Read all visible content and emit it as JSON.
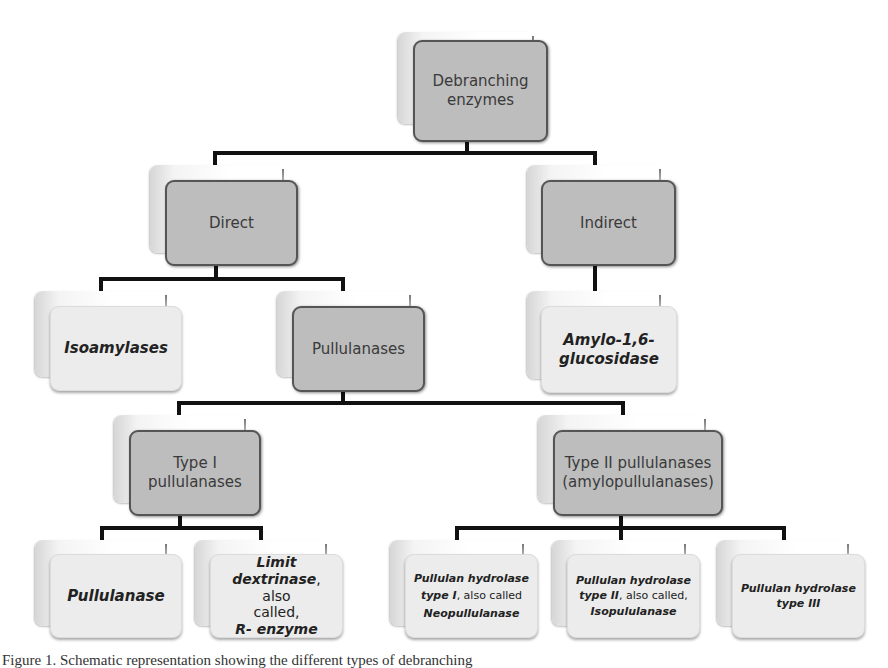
{
  "diagram": {
    "root": {
      "label_line1": "Debranching",
      "label_line2": "enzymes"
    },
    "level1": {
      "direct": {
        "label": "Direct"
      },
      "indirect": {
        "label": "Indirect"
      }
    },
    "level2": {
      "isoamylases": {
        "label": "Isoamylases"
      },
      "pullulanases": {
        "label": "Pullulanases"
      },
      "amylo": {
        "label_line1": "Amylo-1,6-",
        "label_line2": "glucosidase"
      }
    },
    "level3": {
      "type1": {
        "label_line1": "Type I",
        "label_line2": "pullulanases"
      },
      "type2": {
        "label_line1": "Type II pullulanases",
        "label_line2": "(amylopullulanases)"
      }
    },
    "level4": {
      "pullulanase": {
        "label": "Pullulanase"
      },
      "limit_dextrinase": {
        "line1": "Limit",
        "line2_bold": "dextrinase",
        "line2_rest": ", also",
        "line3": "called,",
        "line4": "R- enzyme"
      },
      "ph1": {
        "line1": "Pullulan hydrolase",
        "line2_bold": "type I",
        "line2_rest": ", also called",
        "line3": "Neopullulanase"
      },
      "ph2": {
        "line1": "Pullulan hydrolase",
        "line2_bold": "type II",
        "line2_rest": ", also called,",
        "line3": "Isopululanase"
      },
      "ph3": {
        "line1": "Pullulan hydrolase",
        "line2": "type III"
      }
    },
    "colors": {
      "dark_node": "#bdbdbd",
      "light_node": "#ececec",
      "connector": "#111111"
    }
  },
  "caption": "Figure 1. Schematic representation showing the different types of debranching"
}
